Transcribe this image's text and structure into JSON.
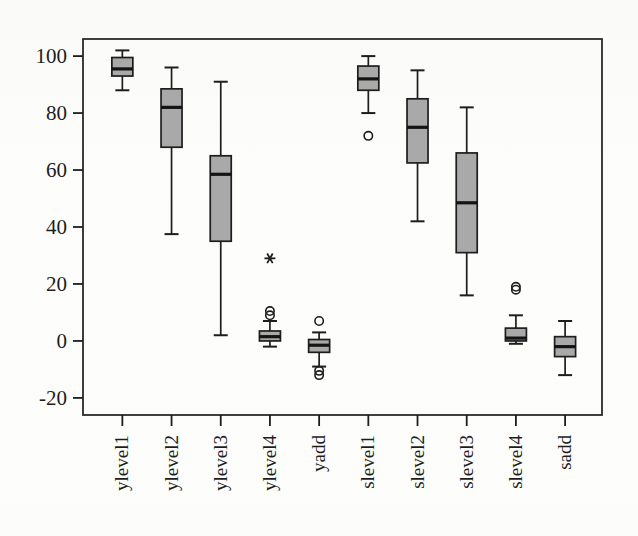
{
  "figure": {
    "background_color": "#fdfdfc",
    "frame_color": "#2b2b2b",
    "box_fill_color": "#a9a9a9",
    "line_color": "#1d1d1d"
  },
  "chart_data": {
    "type": "box",
    "title": "",
    "xlabel": "",
    "ylabel": "",
    "ylim": [
      -26,
      106
    ],
    "yticks": [
      -20,
      0,
      20,
      40,
      60,
      80,
      100
    ],
    "ytick_labels": [
      "-20",
      "0",
      "20",
      "40",
      "60",
      "80",
      "100"
    ],
    "grid": false,
    "legend": null,
    "xtick_label_rotation": 90,
    "categories": [
      "ylevel1",
      "ylevel2",
      "ylevel3",
      "ylevel4",
      "yadd",
      "slevel1",
      "slevel2",
      "slevel3",
      "slevel4",
      "sadd"
    ],
    "boxes": [
      {
        "name": "ylevel1",
        "whisker_low": 88.0,
        "q1": 93.0,
        "median": 95.5,
        "q3": 99.5,
        "whisker_high": 102.0,
        "outliers": [],
        "extreme_outliers": []
      },
      {
        "name": "ylevel2",
        "whisker_low": 37.5,
        "q1": 68.0,
        "median": 82.0,
        "q3": 88.5,
        "whisker_high": 96.0,
        "outliers": [],
        "extreme_outliers": []
      },
      {
        "name": "ylevel3",
        "whisker_low": 2.0,
        "q1": 35.0,
        "median": 58.5,
        "q3": 65.0,
        "whisker_high": 91.0,
        "outliers": [],
        "extreme_outliers": []
      },
      {
        "name": "ylevel4",
        "whisker_low": -2.0,
        "q1": 0.0,
        "median": 1.5,
        "q3": 3.5,
        "whisker_high": 7.0,
        "outliers": [
          9.0,
          10.5
        ],
        "extreme_outliers": [
          29.0
        ]
      },
      {
        "name": "yadd",
        "whisker_low": -9.0,
        "q1": -4.0,
        "median": -1.5,
        "q3": 0.5,
        "whisker_high": 3.0,
        "outliers": [
          7.0,
          -10.5,
          -12.0
        ],
        "extreme_outliers": []
      },
      {
        "name": "slevel1",
        "whisker_low": 80.0,
        "q1": 88.0,
        "median": 92.0,
        "q3": 96.5,
        "whisker_high": 100.0,
        "outliers": [
          72.0
        ],
        "extreme_outliers": []
      },
      {
        "name": "slevel2",
        "whisker_low": 42.0,
        "q1": 62.5,
        "median": 75.0,
        "q3": 85.0,
        "whisker_high": 95.0,
        "outliers": [],
        "extreme_outliers": []
      },
      {
        "name": "slevel3",
        "whisker_low": 16.0,
        "q1": 31.0,
        "median": 48.5,
        "q3": 66.0,
        "whisker_high": 82.0,
        "outliers": [],
        "extreme_outliers": []
      },
      {
        "name": "slevel4",
        "whisker_low": -1.0,
        "q1": 0.0,
        "median": 1.0,
        "q3": 4.5,
        "whisker_high": 9.0,
        "outliers": [
          18.0,
          19.0
        ],
        "extreme_outliers": []
      },
      {
        "name": "sadd",
        "whisker_low": -12.0,
        "q1": -5.5,
        "median": -2.0,
        "q3": 1.5,
        "whisker_high": 7.0,
        "outliers": [],
        "extreme_outliers": []
      }
    ]
  }
}
